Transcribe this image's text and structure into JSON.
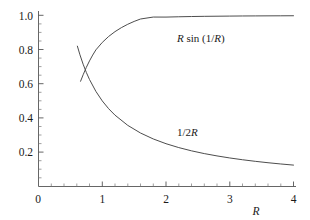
{
  "chart_data": {
    "type": "line",
    "title": "",
    "xlabel": "R",
    "ylabel": "",
    "xlim": [
      0,
      4.12
    ],
    "ylim": [
      0,
      1.04
    ],
    "grid": false,
    "legend": "inline-curve-labels",
    "x_ticks": [
      "0",
      "1",
      "2",
      "3",
      "4"
    ],
    "x_tick_values": [
      0,
      1,
      2,
      3,
      4
    ],
    "x_minor_step": 0.2,
    "y_ticks": [
      "0.2",
      "0.4",
      "0.6",
      "0.8",
      "1.0"
    ],
    "y_tick_values": [
      0.2,
      0.4,
      0.6,
      0.8,
      1.0
    ],
    "y_minor_step": 0.05,
    "origin_label": "0",
    "series": [
      {
        "name": "R sin (1/R)",
        "label_text_parts": [
          "R",
          " sin (1/",
          "R",
          ")"
        ],
        "formula": "y = R*sin(1/R)",
        "x_start": 0.66,
        "x_end": 4.0,
        "x": [
          0.66,
          0.7,
          0.75,
          0.8,
          0.85,
          0.9,
          1.0,
          1.1,
          1.2,
          1.3,
          1.4,
          1.5,
          1.6,
          1.8,
          2.0,
          2.2,
          2.4,
          2.6,
          2.8,
          3.0,
          3.2,
          3.4,
          3.6,
          3.8,
          4.0
        ],
        "y": [
          0.6148,
          0.6525,
          0.6955,
          0.7337,
          0.7677,
          0.798,
          0.8415,
          0.8763,
          0.9046,
          0.928,
          0.9476,
          0.9642,
          0.9784,
          0.9897,
          0.9896,
          0.9914,
          0.9928,
          0.9939,
          0.9947,
          0.9954,
          0.996,
          0.9964,
          0.9968,
          0.9971,
          0.9974
        ]
      },
      {
        "name": "1/2R",
        "label_text_parts": [
          "1/2",
          "R"
        ],
        "formula": "y = 1/(2R)",
        "x_start": 0.61,
        "x_end": 4.0,
        "x": [
          0.61,
          0.65,
          0.7,
          0.75,
          0.8,
          0.9,
          1.0,
          1.1,
          1.2,
          1.4,
          1.6,
          1.8,
          2.0,
          2.2,
          2.4,
          2.6,
          2.8,
          3.0,
          3.2,
          3.4,
          3.6,
          3.8,
          4.0
        ],
        "y": [
          0.8197,
          0.7692,
          0.7143,
          0.6667,
          0.625,
          0.5556,
          0.5,
          0.4545,
          0.4167,
          0.3571,
          0.3125,
          0.2778,
          0.25,
          0.2273,
          0.2083,
          0.1923,
          0.1786,
          0.1667,
          0.1563,
          0.1471,
          0.1389,
          0.1316,
          0.125
        ]
      }
    ],
    "intersection": {
      "x": 0.7246,
      "y": 0.69
    },
    "colors": {
      "curve": "#4d4d4d",
      "axis": "#555555",
      "text": "#1a1a1a",
      "background": "#ffffff"
    }
  },
  "labels": {
    "upper_curve": "R sin (1/R)",
    "lower_curve": "1/2R",
    "x_axis_title": "R"
  }
}
